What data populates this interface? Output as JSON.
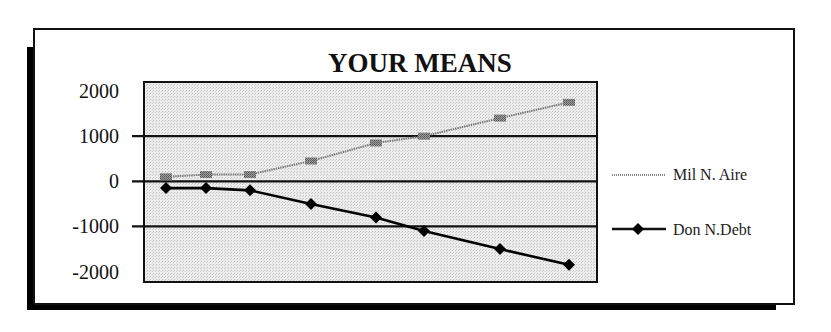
{
  "chart_data": {
    "type": "line",
    "title": "YOUR MEANS",
    "xlabel": "",
    "ylabel": "",
    "ylim": [
      -2230,
      2200
    ],
    "y_ticks": [
      2000,
      1000,
      0,
      -1000,
      -2000
    ],
    "y_tick_labels": [
      "2000",
      "1000",
      "0",
      "-1000",
      "-2000"
    ],
    "gridlines_at": [
      1000,
      0,
      -1000
    ],
    "grid": true,
    "legend_position": "right",
    "x_positions_px": [
      166,
      206,
      250,
      311,
      376,
      424,
      500,
      569
    ],
    "series": [
      {
        "name": "Mil N. Aire",
        "color": "#8a8a8a",
        "marker": "square",
        "values": [
          100,
          150,
          150,
          450,
          850,
          1000,
          1400,
          1750
        ]
      },
      {
        "name": "Don N.Debt",
        "color": "#000000",
        "marker": "diamond",
        "values": [
          -150,
          -150,
          -200,
          -500,
          -800,
          -1100,
          -1500,
          -1850
        ]
      }
    ]
  },
  "colors": {
    "plot_background": "#e6e6e6",
    "frame": "#111111",
    "gridline": "#111111"
  }
}
